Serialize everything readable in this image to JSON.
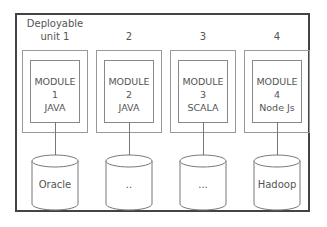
{
  "diagram": {
    "title": "",
    "units": [
      {
        "label_line1": "Deployable",
        "label_line2": "unit 1",
        "module_line1": "MODULE",
        "module_line2": "1",
        "module_line3": "JAVA",
        "database": "Oracle"
      },
      {
        "label_line1": "",
        "label_line2": "2",
        "module_line1": "MODULE",
        "module_line2": "2",
        "module_line3": "JAVA",
        "database": ".."
      },
      {
        "label_line1": "",
        "label_line2": "3",
        "module_line1": "MODULE",
        "module_line2": "3",
        "module_line3": "SCALA",
        "database": "..."
      },
      {
        "label_line1": "",
        "label_line2": "4",
        "module_line1": "MODULE",
        "module_line2": "4",
        "module_line3": "Node Js",
        "database": "Hadoop"
      }
    ]
  }
}
